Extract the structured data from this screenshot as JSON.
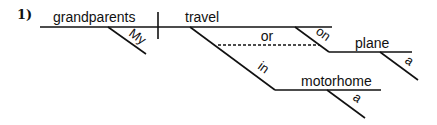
{
  "problem": {
    "number": "1)"
  },
  "diagram": {
    "subject": "grandparents",
    "verb": "travel",
    "subject_modifier": "My",
    "conjunction": "or",
    "prepositions": [
      {
        "word": "on",
        "object": "plane",
        "object_modifier": "a"
      },
      {
        "word": "in",
        "object": "motorhome",
        "object_modifier": "a"
      }
    ],
    "colors": {
      "line": "#111111",
      "text": "#111111",
      "background": "#ffffff"
    }
  }
}
